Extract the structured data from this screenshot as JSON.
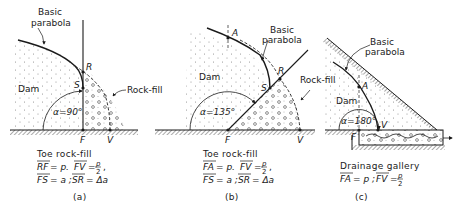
{
  "figure": {
    "panels": [
      {
        "id": "a",
        "label": "(a)",
        "title": "Toe rock-fill",
        "parabola_label_1": "Basic",
        "parabola_label_2": "parabola",
        "dam_label": "Dam",
        "rockfill_label": "Rock-fill",
        "angle_label": "α=90°",
        "points": {
          "R": "R",
          "S": "S",
          "F": "F",
          "V": "V"
        },
        "eq_line1_a": "RF",
        "eq_line1_a_val": "= p.",
        "eq_line1_b": "FV",
        "eq_line1_b_num": "p",
        "eq_line1_b_den": "2",
        "eq_line2_a": "FS",
        "eq_line2_a_val": "= a ;",
        "eq_line2_b": "SR",
        "eq_line2_b_val": "= Δa"
      },
      {
        "id": "b",
        "label": "(b)",
        "title": "Toe rock-fill",
        "parabola_label_1": "Basic",
        "parabola_label_2": "parabola",
        "dam_label": "Dam",
        "rockfill_label": "Rock-fill",
        "angle_label": "α=135°",
        "points": {
          "A": "A",
          "R": "R",
          "S": "S",
          "F": "F",
          "V": "V"
        },
        "eq_line1_a": "FA",
        "eq_line1_a_val": "= p.",
        "eq_line1_b": "FV",
        "eq_line1_b_num": "p",
        "eq_line1_b_den": "2",
        "eq_line2_a": "FS",
        "eq_line2_a_val": "= a ;",
        "eq_line2_b": "SR",
        "eq_line2_b_val": "= Δa"
      },
      {
        "id": "c",
        "label": "(c)",
        "title": "Drainage gallery",
        "parabola_label_1": "Basic",
        "parabola_label_2": "parabola",
        "dam_label": "Dam",
        "angle_label": "α=180°",
        "points": {
          "A": "A",
          "F": "F",
          "V": "V"
        },
        "eq_line1_a": "FA",
        "eq_line1_a_val": "= p ;",
        "eq_line1_b": "FV",
        "eq_line1_b_num": "p",
        "eq_line1_b_den": "2"
      }
    ],
    "colors": {
      "ink": "#1a1a1a",
      "hatch": "#555555",
      "background": "#ffffff"
    }
  }
}
